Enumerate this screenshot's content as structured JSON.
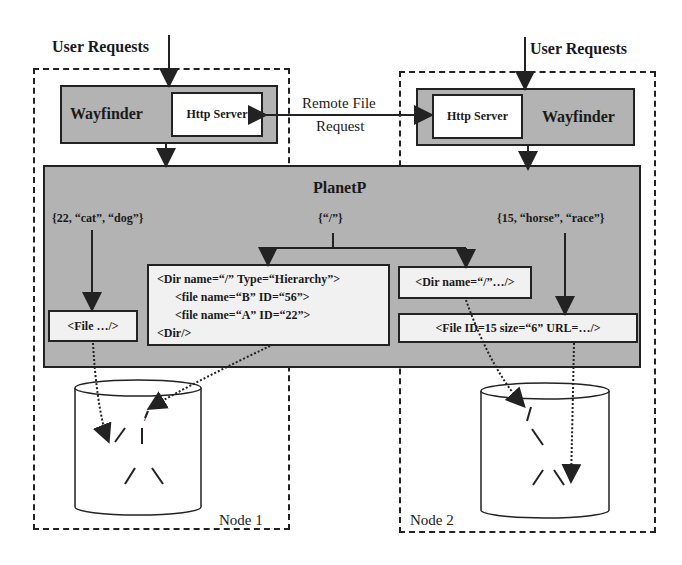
{
  "diagram": {
    "user_requests_left": "User Requests",
    "user_requests_right": "User Requests",
    "remote_request_line1": "Remote File",
    "remote_request_line2": "Request",
    "planetp_title": "PlanetP",
    "node1": {
      "label": "Node 1",
      "wayfinder": "Wayfinder",
      "http_server": "Http Server",
      "query": "{22, “cat”, “dog”}",
      "file_box": "<File …/>",
      "dir_box_lines": [
        "<Dir name=“/” Type=“Hierarchy”>",
        "<file name=“B” ID=“56”>",
        "<file name=“A” ID=“22”>",
        "<Dir/>"
      ],
      "tree": {
        "root": "/",
        "nodes": [
          "A",
          "B",
          "C",
          "D"
        ]
      }
    },
    "center_query": "{“/”}",
    "node2": {
      "label": "Node 2",
      "wayfinder": "Wayfinder",
      "http_server": "Http Server",
      "query": "{15, “horse”, “race”}",
      "dir_box": "<Dir name=“/”…/>",
      "file_box": "<File ID=15 size=“6” URL=…/>",
      "tree": {
        "root": "/",
        "nodes": [
          "B",
          "C",
          "E"
        ]
      }
    },
    "colors": {
      "gray_fill": "#b3b3b3",
      "box_fill": "#f1f1f1",
      "line": "#222222"
    }
  }
}
